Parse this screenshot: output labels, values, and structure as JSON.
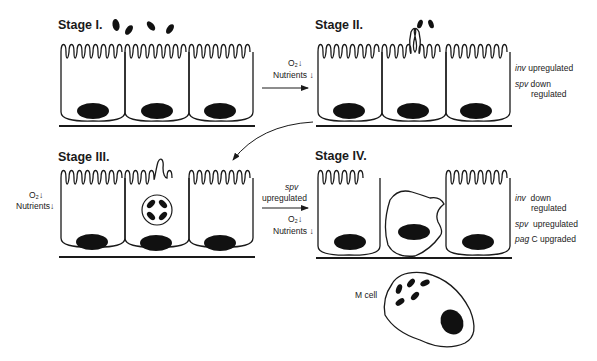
{
  "stages": [
    {
      "id": "stage-1",
      "title": "Stage I."
    },
    {
      "id": "stage-2",
      "title": "Stage II."
    },
    {
      "id": "stage-3",
      "title": "Stage III."
    },
    {
      "id": "stage-4",
      "title": "Stage IV."
    }
  ],
  "transitions": {
    "i_to_ii": {
      "o2": "O₂",
      "o2_arrow": "↓",
      "nutrients": "Nutrients",
      "nutrients_arrow": "↓"
    },
    "iii_left": {
      "o2": "O₂",
      "o2_arrow": "↓",
      "nutrients": "Nutrients",
      "nutrients_arrow": "↓"
    },
    "iii_to_iv": {
      "gene": "spv",
      "gene_state": "upregulated",
      "o2": "O₂",
      "o2_arrow": "↓",
      "nutrients": "Nutrients",
      "nutrients_arrow": "↓"
    }
  },
  "annotations": {
    "stage2": [
      {
        "gene": "inv",
        "text": "upregulated"
      },
      {
        "gene": "spv",
        "text": "down",
        "text2": "regulated"
      }
    ],
    "stage4": [
      {
        "gene": "inv",
        "text": "down",
        "text2": "regulated"
      },
      {
        "gene": "spv",
        "text": "upregulated"
      },
      {
        "gene": "pag",
        "text": "C upgraded"
      }
    ]
  },
  "m_cell": {
    "label": "M cell"
  },
  "colors": {
    "stroke": "#1a1a1a",
    "fill": "#111111",
    "background": "#ffffff"
  }
}
